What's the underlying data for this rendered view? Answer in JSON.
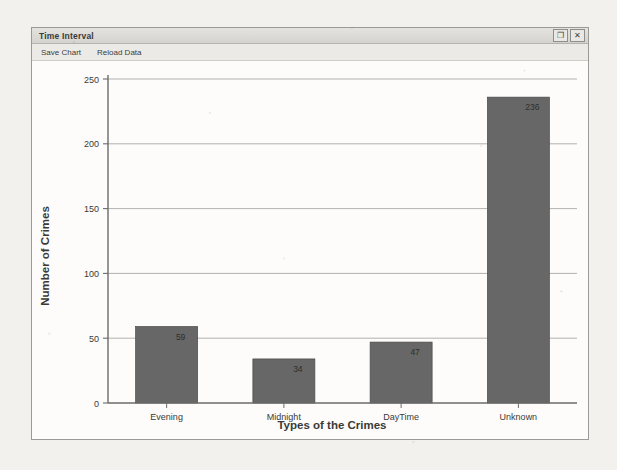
{
  "window": {
    "title": "Time Interval",
    "controls": [
      {
        "name": "restore-button",
        "glyph": "❐"
      },
      {
        "name": "close-button",
        "glyph": "✕"
      }
    ]
  },
  "menu": {
    "items": [
      {
        "label": "Save Chart"
      },
      {
        "label": "Reload Data"
      }
    ]
  },
  "colors": {
    "bar_fill": "#676767",
    "bar_fill_light": "#7a7a7a",
    "bar_stroke": "#4a4a4a",
    "axis": "#6b6b6b",
    "grid": "#9e9e9e",
    "plot_bg": "#fdfcfa",
    "text": "#3a3a38"
  },
  "chart_data": {
    "type": "bar",
    "title": "",
    "categories": [
      "Evening",
      "Midnight",
      "DayTime",
      "Unknown"
    ],
    "values": [
      59,
      34,
      47,
      236
    ],
    "value_labels": [
      "59",
      "34",
      "47",
      "236"
    ],
    "xlabel": "Types of the Crimes",
    "ylabel": "Number of Crimes",
    "ylim": [
      0,
      250
    ],
    "yticks": [
      0,
      50,
      100,
      150,
      200,
      250
    ],
    "ytick_labels": [
      "0",
      "50",
      "100",
      "150",
      "200",
      "250"
    ],
    "grid": true,
    "legend": false
  }
}
